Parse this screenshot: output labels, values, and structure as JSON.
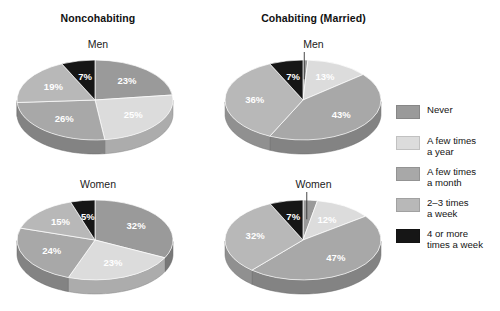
{
  "panels": [
    {
      "group_title": "Noncohabiting",
      "charts": [
        {
          "sex_label": "Men",
          "labels": [
            "23%",
            "25%",
            "26%",
            "19%",
            "7%"
          ]
        },
        {
          "sex_label": "Women",
          "labels": [
            "32%",
            "23%",
            "24%",
            "15%",
            "5%"
          ]
        }
      ]
    },
    {
      "group_title": "Cohabiting (Married)",
      "charts": [
        {
          "sex_label": "Men",
          "labels": [
            "1%",
            "13%",
            "43%",
            "36%",
            "7%"
          ]
        },
        {
          "sex_label": "Women",
          "labels": [
            "3%",
            "12%",
            "47%",
            "32%",
            "7%"
          ]
        }
      ]
    }
  ],
  "legend": {
    "items": [
      {
        "label": "Never",
        "color": "#9a9a9a"
      },
      {
        "label": "A few times\na year",
        "color": "#dcdcdc"
      },
      {
        "label": "A few times\na month",
        "color": "#a8a8a8"
      },
      {
        "label": "2–3 times\na week",
        "color": "#b8b8b8"
      },
      {
        "label": "4 or more\ntimes a week",
        "color": "#161616"
      }
    ]
  },
  "chart_data": {
    "type": "pie",
    "categories": [
      "Never",
      "A few times a year",
      "A few times a month",
      "2–3 times a week",
      "4 or more times a week"
    ],
    "colors": [
      "#9a9a9a",
      "#dcdcdc",
      "#a8a8a8",
      "#b8b8b8",
      "#161616"
    ],
    "legend_position": "right",
    "units": "percent",
    "series": [
      {
        "name": "Noncohabiting — Men",
        "values": [
          23,
          25,
          26,
          19,
          7
        ]
      },
      {
        "name": "Noncohabiting — Women",
        "values": [
          32,
          23,
          24,
          15,
          5
        ]
      },
      {
        "name": "Cohabiting (Married) — Men",
        "values": [
          1,
          13,
          43,
          36,
          7
        ]
      },
      {
        "name": "Cohabiting (Married) — Women",
        "values": [
          3,
          12,
          47,
          32,
          7
        ]
      }
    ]
  }
}
